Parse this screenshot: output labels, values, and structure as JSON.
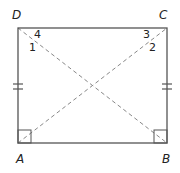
{
  "diagram": {
    "type": "rectangle-with-diagonals",
    "vertices": {
      "D": {
        "label": "D",
        "x": 18,
        "y": 28
      },
      "C": {
        "label": "C",
        "x": 167,
        "y": 28
      },
      "A": {
        "label": "A",
        "x": 18,
        "y": 143
      },
      "B": {
        "label": "B",
        "x": 167,
        "y": 143
      }
    },
    "angle_labels": {
      "a1": "1",
      "a2": "2",
      "a3": "3",
      "a4": "4"
    },
    "congruent_marks": {
      "left_side": "AD",
      "right_side": "BC",
      "tick_count": 2
    },
    "right_angles": [
      "A",
      "B"
    ],
    "diagonals": [
      "AC",
      "BD"
    ],
    "colors": {
      "stroke": "#555555",
      "diagonal": "#888888",
      "text": "#222222"
    }
  }
}
